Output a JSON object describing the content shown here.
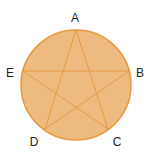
{
  "diagram": {
    "title": "",
    "circle": {
      "cx": 76,
      "cy": 85,
      "r": 55,
      "fill": "#EDBB80",
      "stroke": "#E8983F"
    },
    "points": [
      {
        "label": "A",
        "x": 76,
        "y": 30,
        "lx": 75,
        "ly": 22
      },
      {
        "label": "B",
        "x": 129,
        "y": 71,
        "lx": 140,
        "ly": 77
      },
      {
        "label": "C",
        "x": 108,
        "y": 129,
        "lx": 117,
        "ly": 146
      },
      {
        "label": "D",
        "x": 45,
        "y": 129,
        "lx": 34,
        "ly": 146
      },
      {
        "label": "E",
        "x": 23,
        "y": 71,
        "lx": 10,
        "ly": 77
      }
    ],
    "star_order": [
      "A",
      "C",
      "E",
      "B",
      "D"
    ],
    "line_color": "#E8983F"
  }
}
